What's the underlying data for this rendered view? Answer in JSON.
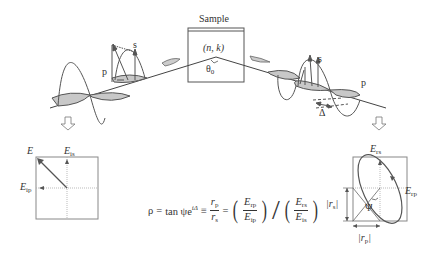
{
  "sample": {
    "title": "Sample",
    "material": "(n, k)",
    "angle": "θ",
    "angle_sub": "0"
  },
  "incident_wave": {
    "s_label": "s",
    "p_label": "p"
  },
  "reflected_wave": {
    "s_label": "s",
    "p_label": "p",
    "phase_label": "Δ"
  },
  "incident_box": {
    "e_label": "E",
    "eis_main": "E",
    "eis_sub": "is",
    "eip_main": "E",
    "eip_sub": "ip"
  },
  "reflected_box": {
    "ers_main": "E",
    "ers_sub": "rs",
    "erp_main": "E",
    "erp_sub": "rp",
    "rs_label_main": "|r",
    "rs_label_sub": "s",
    "rs_label_end": "|",
    "rp_label_main": "|r",
    "rp_label_sub": "p",
    "rp_label_end": "|",
    "psi_label": "Ψ"
  },
  "formula": {
    "rho": "ρ",
    "eq1": "=",
    "tan": "tan ψe",
    "exp": "iΔ",
    "eq2": "≡",
    "rp": "r",
    "rp_sub": "p",
    "rs": "r",
    "rs_sub": "s",
    "eq3": "=",
    "erp": "E",
    "erp_sub": "rp",
    "eip": "E",
    "eip_sub": "ip",
    "slash": "/",
    "ers": "E",
    "ers_sub": "rs",
    "eis": "E",
    "eis_sub": "is"
  },
  "colors": {
    "line": "#444444",
    "fill": "#c8c8c8",
    "box": "#888888",
    "dotted": "#999999"
  }
}
